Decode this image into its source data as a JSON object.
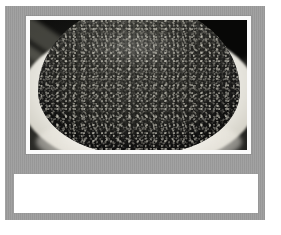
{
  "page": {
    "background_color": "#ffffff",
    "panel_color": "#9d9d9d",
    "mat_color": "#fbfbfb",
    "caption_box_color": "#ffffff"
  },
  "panel": {
    "name": "image-panel"
  },
  "photo": {
    "alt": "Close-up photograph of black caviar (fish roe) heaped in a white bowl",
    "subject": "black caviar in white bowl",
    "dominant_colors": [
      "#2b2b27",
      "#f6f5f1",
      "#0d0d0c"
    ]
  },
  "caption": {
    "text": "",
    "placeholder": ""
  }
}
